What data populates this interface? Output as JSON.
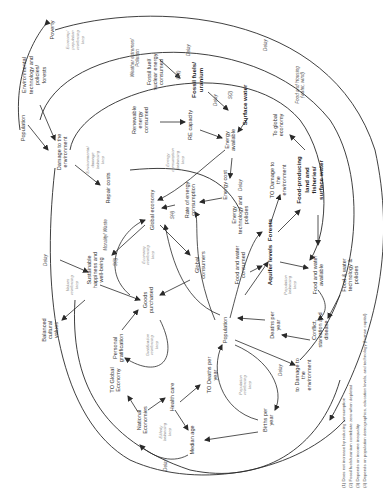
{
  "diagram": {
    "orientation": "rotated 90 degrees clockwise (text reads bottom-to-top)",
    "nodes": [
      {
        "id": "poverty",
        "label": "Poverty",
        "x": 52,
        "y": 30,
        "bold": false
      },
      {
        "id": "env-tech",
        "label": "Environmental technology and policies/ forests",
        "x": 34,
        "y": 75,
        "bold": false
      },
      {
        "id": "population-top",
        "label": "Population",
        "x": 23,
        "y": 128,
        "bold": false
      },
      {
        "id": "damage-env-top",
        "label": "Damage to the environment",
        "x": 62,
        "y": 152,
        "bold": false
      },
      {
        "id": "repair-costs",
        "label": "Repair costs",
        "x": 108,
        "y": 188,
        "bold": false
      },
      {
        "id": "renewable",
        "label": "Renewable energy consumed",
        "x": 140,
        "y": 120,
        "bold": false
      },
      {
        "id": "fossil-consumed",
        "label": "Fossil fuel/ nuclear energy consumed",
        "x": 155,
        "y": 72,
        "bold": false
      },
      {
        "id": "fossil-uranium",
        "label": "Fossil fuels/ uranium",
        "x": 197,
        "y": 80,
        "bold": true
      },
      {
        "id": "surface-water",
        "label": "Surface water",
        "x": 245,
        "y": 105,
        "bold": true
      },
      {
        "id": "re-capacity",
        "label": "RE capacity",
        "x": 190,
        "y": 125,
        "bold": false
      },
      {
        "id": "energy-available",
        "label": "Energy available",
        "x": 230,
        "y": 140,
        "bold": false
      },
      {
        "id": "energy-cost",
        "label": "Energy cost",
        "x": 225,
        "y": 185,
        "bold": false
      },
      {
        "id": "rate-energy",
        "label": "Rate of energy consumption",
        "x": 190,
        "y": 200,
        "bold": false
      },
      {
        "id": "global-economy",
        "label": "Global economy",
        "x": 152,
        "y": 210,
        "bold": false
      },
      {
        "id": "energy-tech",
        "label": "Energy technology and policies",
        "x": 240,
        "y": 215,
        "bold": false
      },
      {
        "id": "to-global-economy-right",
        "label": "To global economy",
        "x": 278,
        "y": 125,
        "bold": false
      },
      {
        "id": "to-damage-right",
        "label": "TO Damage to the environment",
        "x": 278,
        "y": 180,
        "bold": false
      },
      {
        "id": "food-land",
        "label": "Food-producing land and fisheries/ surface water",
        "x": 310,
        "y": 180,
        "bold": true
      },
      {
        "id": "forests",
        "label": "Forests",
        "x": 270,
        "y": 230,
        "bold": true
      },
      {
        "id": "aquifer",
        "label": "Aquifer levels",
        "x": 270,
        "y": 265,
        "bold": true
      },
      {
        "id": "food-water-consumed",
        "label": "Food and water consumed",
        "x": 240,
        "y": 265,
        "bold": false
      },
      {
        "id": "food-water-available",
        "label": "Food and water available",
        "x": 318,
        "y": 275,
        "bold": false
      },
      {
        "id": "food-water-tech",
        "label": "Food & water technology & policies",
        "x": 350,
        "y": 275,
        "bold": false
      },
      {
        "id": "global-consumers",
        "label": "Global consumers",
        "x": 200,
        "y": 265,
        "bold": false
      },
      {
        "id": "population-main",
        "label": "Population",
        "x": 225,
        "y": 330,
        "bold": false
      },
      {
        "id": "deaths-per-year",
        "label": "Deaths per year",
        "x": 275,
        "y": 325,
        "bold": false
      },
      {
        "id": "conflict",
        "label": "Conflict, starvation and disease",
        "x": 320,
        "y": 330,
        "bold": false
      },
      {
        "id": "to-damage-bottom",
        "label": "to Damage to the environment",
        "x": 303,
        "y": 375,
        "bold": false
      },
      {
        "id": "goods-purchased",
        "label": "Goods purchased",
        "x": 148,
        "y": 300,
        "bold": false
      },
      {
        "id": "sustainable-happiness",
        "label": "Sustainable happiness and well-being",
        "x": 95,
        "y": 270,
        "bold": false
      },
      {
        "id": "balanced-values",
        "label": "Balanced cultural values",
        "x": 50,
        "y": 330,
        "bold": false
      },
      {
        "id": "personal-gratification",
        "label": "Personal gratification",
        "x": 118,
        "y": 348,
        "bold": false
      },
      {
        "id": "to-global-economy-left",
        "label": "TO Global Economy",
        "x": 115,
        "y": 380,
        "bold": false
      },
      {
        "id": "national-economies",
        "label": "National Economies",
        "x": 142,
        "y": 420,
        "bold": false
      },
      {
        "id": "health-care",
        "label": "Health care",
        "x": 172,
        "y": 397,
        "bold": false
      },
      {
        "id": "to-deaths",
        "label": "TO Deaths per year",
        "x": 212,
        "y": 375,
        "bold": false
      },
      {
        "id": "median-age",
        "label": "Median age",
        "x": 192,
        "y": 440,
        "bold": false
      },
      {
        "id": "births-per-year",
        "label": "Births per year",
        "x": 268,
        "y": 420,
        "bold": false
      }
    ],
    "loops": [
      {
        "label": "Economy/ population reinforcing loop",
        "x": 75,
        "y": 40
      },
      {
        "label": "Environmental damage balancing loop",
        "x": 95,
        "y": 160
      },
      {
        "label": "Energy consumption balancing loop",
        "x": 175,
        "y": 160
      },
      {
        "label": "Economy reinforcing loop",
        "x": 148,
        "y": 255
      },
      {
        "label": "Values reinforcing loop",
        "x": 72,
        "y": 285
      },
      {
        "label": "Gratification reinforcing loop",
        "x": 152,
        "y": 345
      },
      {
        "label": "Population balancing loop",
        "x": 290,
        "y": 285
      },
      {
        "label": "Population reinforcing loop",
        "x": 245,
        "y": 385
      },
      {
        "label": "Elderly balancing loop",
        "x": 165,
        "y": 432
      }
    ],
    "annotations": [
      {
        "label": "Weather extremes/ Pollution",
        "x": 135,
        "y": 58
      },
      {
        "label": "Delay",
        "x": 188,
        "y": 50
      },
      {
        "label": "Delay",
        "x": 215,
        "y": 100
      },
      {
        "label": "Delay",
        "x": 265,
        "y": 45
      },
      {
        "label": "Delay",
        "x": 240,
        "y": 185
      },
      {
        "label": "Delay",
        "x": 45,
        "y": 260
      },
      {
        "label": "Delay",
        "x": 280,
        "y": 370
      },
      {
        "label": "Delay",
        "x": 165,
        "y": 465
      },
      {
        "label": "Food and Housing (water, wind)",
        "x": 300,
        "y": 85
      },
      {
        "label": "Morality/ Waste",
        "x": 105,
        "y": 235
      },
      {
        "label": "O(1)",
        "x": 178,
        "y": 75
      },
      {
        "label": "S(2)",
        "x": 230,
        "y": 95
      },
      {
        "label": "S(3)",
        "x": 115,
        "y": 262
      },
      {
        "label": "S(4)",
        "x": 172,
        "y": 215
      }
    ],
    "footnotes": [
      "(1) Does not increase by reducing consumption",
      "(2) Fossil fuels/uranium contribute zero when depleted",
      "(3) Depends on income inequality",
      "(4) Depends on population demographics, education levels, and technology (human capital)"
    ]
  }
}
